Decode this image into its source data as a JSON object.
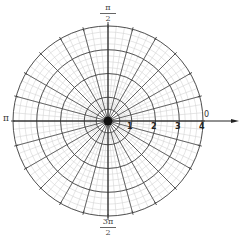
{
  "diagram": {
    "type": "polar-grid",
    "center": {
      "x": 108,
      "y": 121
    },
    "outer_radius": 95,
    "rings": [
      1,
      2,
      3,
      4
    ],
    "spoke_step_degrees": 15,
    "minor_ring_step": 0.25,
    "minor_spoke_step_degrees": 5,
    "colors": {
      "major": "#444444",
      "minor": "#d4d4d4",
      "axis": "#222222",
      "center_dot": "#111111"
    }
  },
  "labels": {
    "angle_zero": "0",
    "angle_pi": "π",
    "angle_half_pi": {
      "numerator": "π",
      "denominator": "2"
    },
    "angle_three_half_pi": {
      "numerator": "3π",
      "denominator": "2"
    },
    "ring_labels": [
      "1",
      "2",
      "3",
      "4"
    ]
  }
}
